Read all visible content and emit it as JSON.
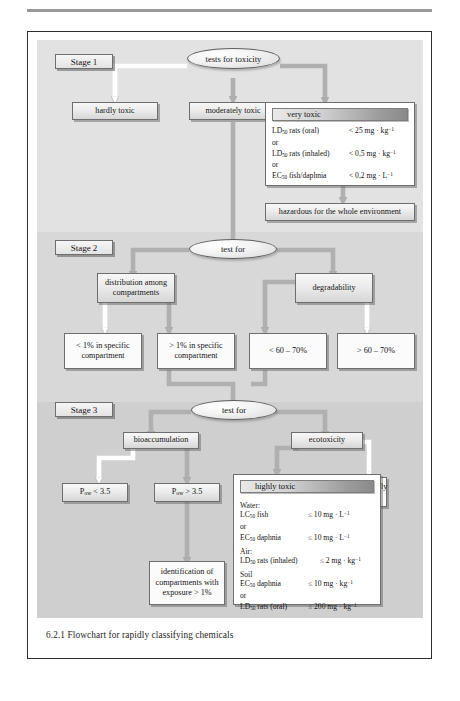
{
  "figure": {
    "caption": "6.2.1 Flowchart for rapidly classifying chemicals"
  },
  "stages": [
    {
      "label": "Stage 1"
    },
    {
      "label": "Stage 2"
    },
    {
      "label": "Stage 3"
    }
  ],
  "stage1": {
    "decision": "tests for toxicity",
    "branches": [
      {
        "label": "hardly toxic"
      },
      {
        "label": "moderately toxic"
      }
    ],
    "panel": {
      "title": "very toxic",
      "rows": [
        {
          "type": "data",
          "label_main": "LD",
          "label_sub": "50",
          "label_rest": " rats (oral)",
          "value": "< 25 mg · kg",
          "value_sup": "−1"
        },
        {
          "type": "or",
          "text": "or"
        },
        {
          "type": "data",
          "label_main": "LD",
          "label_sub": "50",
          "label_rest": "  rats (inhaled)",
          "value": "< 0,5 mg · kg",
          "value_sup": "−1"
        },
        {
          "type": "or",
          "text": "or"
        },
        {
          "type": "data",
          "label_main": "EC",
          "label_sub": "50",
          "label_rest": "  fish/daphnia",
          "value": "< 0,2 mg · L",
          "value_sup": "−1"
        }
      ]
    },
    "outcome": "hazardous for the whole environment"
  },
  "stage2": {
    "decision": "test for",
    "tests": [
      {
        "label": "distribution among compartments"
      },
      {
        "label": "degradability"
      }
    ],
    "results": [
      {
        "label": "< 1% in specific compartment"
      },
      {
        "label": "> 1% in specific compartment"
      },
      {
        "label": "< 60 – 70%"
      },
      {
        "label": "> 60 – 70%"
      }
    ]
  },
  "stage3": {
    "decision": "test for",
    "tests": [
      {
        "label": "bioaccumulation"
      },
      {
        "label": "ecotoxicity"
      }
    ],
    "pow_low": {
      "main": "P",
      "sub": "ow",
      "rest": " < 3.5"
    },
    "pow_high": {
      "main": "P",
      "sub": "ow",
      "rest": " > 3.5"
    },
    "identification": "identification of compartments with exposure > 1%",
    "moderately_toxic": "moderately toxic",
    "panel": {
      "title": "highly toxic",
      "groups": [
        {
          "heading": "Water:",
          "rows": [
            {
              "type": "data",
              "label_main": "LC",
              "label_sub": "50",
              "label_rest": " fish",
              "value": "≤ 10 mg · L",
              "value_sup": "−1"
            },
            {
              "type": "or",
              "text": "or"
            },
            {
              "type": "data",
              "label_main": "EC",
              "label_sub": "50",
              "label_rest": "  daphnia",
              "value": "≤ 10 mg · L",
              "value_sup": "−1"
            }
          ]
        },
        {
          "heading": "Air:",
          "rows": [
            {
              "type": "data",
              "label_main": "LD",
              "label_sub": "50",
              "label_rest": " rats (inhaled)",
              "value": "≤ 2 mg · kg",
              "value_sup": "−1"
            }
          ]
        },
        {
          "heading": "Soil",
          "rows": [
            {
              "type": "data",
              "label_main": "EC",
              "label_sub": "50",
              "label_rest": "  daphnia",
              "value": "≤ 10 mg · kg",
              "value_sup": "−1"
            },
            {
              "type": "or",
              "text": "or"
            },
            {
              "type": "data",
              "label_main": "LD",
              "label_sub": "50",
              "label_rest": " rats (oral)",
              "value": "≤ 200 mg · kg",
              "value_sup": "−1"
            }
          ]
        }
      ]
    },
    "outcome": "hazardous for specific compartment"
  },
  "colors": {
    "band1": "#e2e2e2",
    "band2": "#d8d8d8",
    "band3": "#cfcfcf",
    "arrow_gray": "#b3b3b3",
    "arrow_white": "#ffffff",
    "node_border": "#6e6e6e",
    "frame_border": "#2d2d2d"
  }
}
